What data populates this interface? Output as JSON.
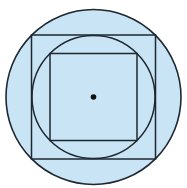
{
  "diagram": {
    "title": "",
    "fill_color": "#c9e4f5",
    "stroke_color": "#1e2830",
    "center": {
      "x": 93.5,
      "y": 97
    },
    "shapes": [
      {
        "type": "circle",
        "role": "outer-circle",
        "cx": 93.5,
        "cy": 97,
        "r": 87.5
      },
      {
        "type": "square",
        "role": "outer-square",
        "x": 31.5,
        "y": 35,
        "size": 124
      },
      {
        "type": "circle",
        "role": "inner-circle",
        "cx": 93.5,
        "cy": 97,
        "r": 61.5
      },
      {
        "type": "square",
        "role": "inner-square",
        "x": 50,
        "y": 53.5,
        "size": 87
      },
      {
        "type": "point",
        "role": "center-point",
        "cx": 93.5,
        "cy": 97,
        "r": 2.8
      }
    ]
  }
}
